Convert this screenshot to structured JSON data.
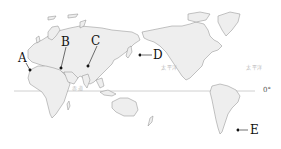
{
  "map": {
    "title": "World map (Pacific-centered) with marked locations",
    "markers": [
      {
        "id": "A",
        "label": "A",
        "x": 30,
        "y": 70
      },
      {
        "id": "B",
        "label": "B",
        "x": 61,
        "y": 68
      },
      {
        "id": "C",
        "label": "C",
        "x": 88,
        "y": 66
      },
      {
        "id": "D",
        "label": "D",
        "x": 140,
        "y": 55
      },
      {
        "id": "E",
        "label": "E",
        "x": 238,
        "y": 130
      }
    ],
    "equator_label": "0°",
    "faint_labels": {
      "equator_text": "赤道",
      "pacific_west": "太平洋",
      "pacific_east": "太平洋",
      "atlantic": "大西洋"
    },
    "colors": {
      "land": "#eeeeee",
      "border": "#8a8a8a",
      "equator": "#bdbdbd",
      "ink": "#111111"
    }
  }
}
